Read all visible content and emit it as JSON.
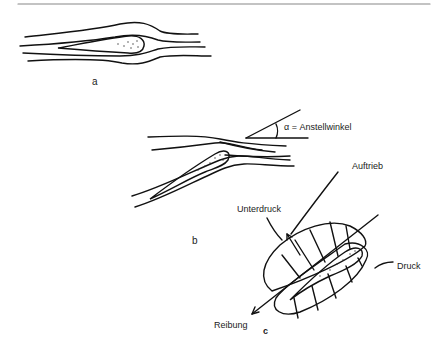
{
  "figure": {
    "panels": [
      {
        "id": "a",
        "label": "a",
        "description": "Symmetrical airfoil at zero angle of attack with streamlines"
      },
      {
        "id": "b",
        "label": "b",
        "description": "Airfoil at angle of attack with streamlines",
        "angle_label": "α = Anstellwinkel"
      },
      {
        "id": "c",
        "label": "c",
        "description": "Pressure distribution around airfoil",
        "labels": {
          "lift": "Auftrieb",
          "suction": "Unterdruck",
          "pressure": "Druck",
          "drag": "Reibung"
        }
      }
    ]
  }
}
